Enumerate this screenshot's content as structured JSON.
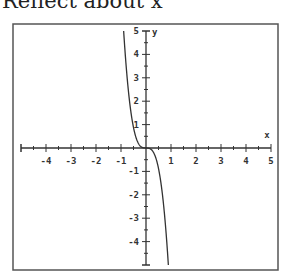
{
  "title": "Reflect about x",
  "chart_data": {
    "type": "line",
    "title": "Reflect about x",
    "xlabel": "x",
    "ylabel": "y",
    "xlim": [
      -5,
      5
    ],
    "ylim": [
      -5,
      5
    ],
    "x_ticks": [
      -4,
      -3,
      -2,
      -1,
      1,
      2,
      3,
      4,
      5
    ],
    "y_ticks": [
      5,
      4,
      3,
      2,
      1,
      -1,
      -2,
      -3,
      -4
    ],
    "minor_tick_step": 0.5,
    "grid": false,
    "series": [
      {
        "name": "reflected curve",
        "function": "y = -7x^3",
        "x_range": [
          -0.894,
          0.894
        ],
        "color": "#333333"
      }
    ]
  }
}
